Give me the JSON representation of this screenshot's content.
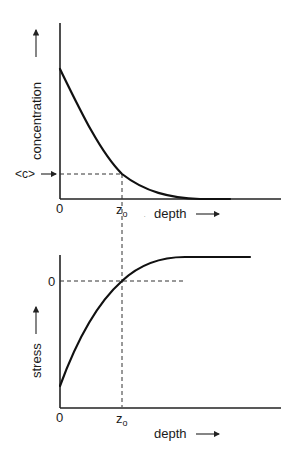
{
  "top_panel": {
    "y_label": "concentration",
    "x_label": "depth",
    "x_label_prefix_dot": ".",
    "origin_label": "0",
    "marker_y_label": "<c>",
    "marker_x_label": "z",
    "marker_x_subscript": "o",
    "curve": "decaying concentration from high value at depth 0 to ~0 at depth beyond z0"
  },
  "bottom_panel": {
    "y_label": "stress",
    "x_label": "depth",
    "origin_label": "0",
    "y_zero_label": "0",
    "marker_x_label": "z",
    "marker_x_subscript": "o",
    "curve": "stress rising from negative at depth 0, crossing zero at z0, plateauing"
  },
  "colors": {
    "line": "#111111",
    "background": "#ffffff"
  }
}
